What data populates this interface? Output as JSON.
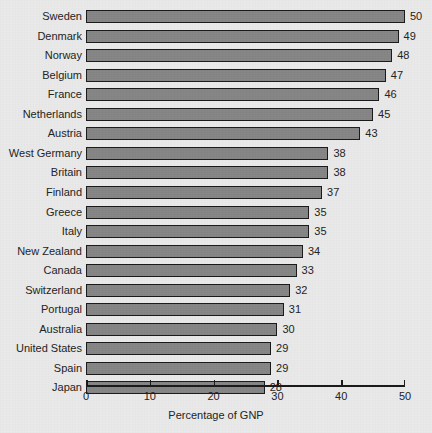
{
  "chart_data": {
    "type": "bar",
    "orientation": "horizontal",
    "title": "",
    "xlabel": "Percentage of GNP",
    "ylabel": "",
    "xlim": [
      0,
      50
    ],
    "xticks": [
      0,
      10,
      20,
      30,
      40,
      50
    ],
    "xtick_labels": [
      "0",
      "10",
      "20",
      "30",
      "40",
      "50"
    ],
    "grid": false,
    "legend": false,
    "categories": [
      "Sweden",
      "Denmark",
      "Norway",
      "Belgium",
      "France",
      "Netherlands",
      "Austria",
      "West Germany",
      "Britain",
      "Finland",
      "Greece",
      "Italy",
      "New Zealand",
      "Canada",
      "Switzerland",
      "Portugal",
      "Australia",
      "United States",
      "Spain",
      "Japan"
    ],
    "values": [
      50,
      49,
      48,
      47,
      46,
      45,
      43,
      38,
      38,
      37,
      35,
      35,
      34,
      33,
      32,
      31,
      30,
      29,
      29,
      28
    ],
    "value_labels": [
      "50",
      "49",
      "48",
      "47",
      "46",
      "45",
      "43",
      "38",
      "38",
      "37",
      "35",
      "35",
      "34",
      "33",
      "32",
      "31",
      "30",
      "29",
      "29",
      "28"
    ]
  },
  "style": {
    "background": "#e9e9e9",
    "bar_fill": "#858585",
    "bar_stroke": "#191919",
    "text_color": "#222222"
  }
}
